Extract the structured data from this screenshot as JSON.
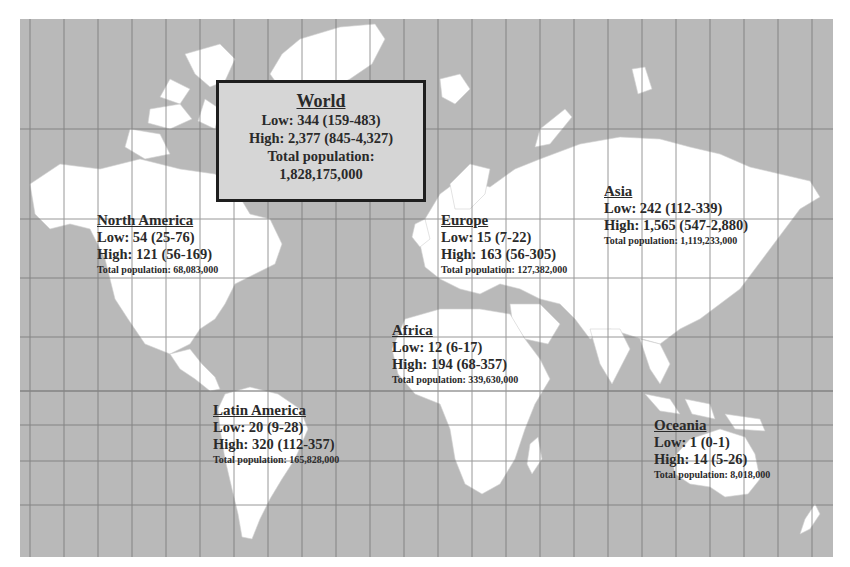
{
  "map": {
    "colors": {
      "ocean": "#b9b9b9",
      "land": "#ffffff",
      "grid": "#6e6e6e",
      "text": "#2a2a2a",
      "world_box_bg": "#d6d6d6"
    }
  },
  "world": {
    "title": "World",
    "low": "Low: 344 (159-483)",
    "high": "High: 2,377 (845-4,327)",
    "pop_label": "Total population:",
    "pop_value": "1,828,175,000"
  },
  "regions": [
    {
      "name": "North America",
      "low": "Low: 54 (25-76)",
      "high": "High: 121 (56-169)",
      "pop": "Total population: 68,083,000"
    },
    {
      "name": "Europe",
      "low": "Low: 15 (7-22)",
      "high": "High: 163 (56-305)",
      "pop": "Total population: 127,382,000"
    },
    {
      "name": "Asia",
      "low": "Low: 242 (112-339)",
      "high": "High: 1,565 (547-2,880)",
      "pop": "Total population: 1,119,233,000"
    },
    {
      "name": "Africa",
      "low": "Low: 12 (6-17)",
      "high": "High: 194 (68-357)",
      "pop": "Total population: 339,630,000"
    },
    {
      "name": "Latin America",
      "low": "Low: 20 (9-28)",
      "high": "High: 320 (112-357)",
      "pop": "Total population: 165,828,000"
    },
    {
      "name": "Oceania",
      "low": "Low: 1 (0-1)",
      "high": "High: 14 (5-26)",
      "pop": "Total population: 8,018,000"
    }
  ]
}
